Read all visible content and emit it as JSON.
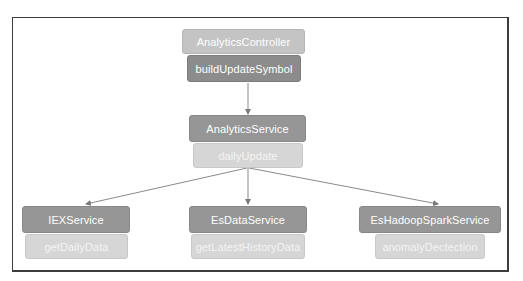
{
  "diagram": {
    "controller": {
      "class_name": "AnalyticsController",
      "method": "buildUpdateSymbol"
    },
    "service": {
      "class_name": "AnalyticsService",
      "method": "dailyUpdate"
    },
    "dependencies": [
      {
        "class_name": "IEXService",
        "method": "getDailyData"
      },
      {
        "class_name": "EsDataService",
        "method": "getLatestHistoryData"
      },
      {
        "class_name": "EsHadoopSparkService",
        "method": "anomalyDectection"
      }
    ],
    "edges": [
      {
        "from": "AnalyticsController.buildUpdateSymbol",
        "to": "AnalyticsService"
      },
      {
        "from": "AnalyticsService.dailyUpdate",
        "to": "IEXService"
      },
      {
        "from": "AnalyticsService.dailyUpdate",
        "to": "EsDataService"
      },
      {
        "from": "AnalyticsService.dailyUpdate",
        "to": "EsHadoopSparkService"
      }
    ],
    "colors": {
      "frame": "#3c3c3c",
      "header_light": "#c4c4c4",
      "header_dark": "#8e8e8e",
      "method_dark": "#8c8c8c",
      "method_light": "#d6d6d6",
      "edge": "#8a8a8a"
    }
  }
}
